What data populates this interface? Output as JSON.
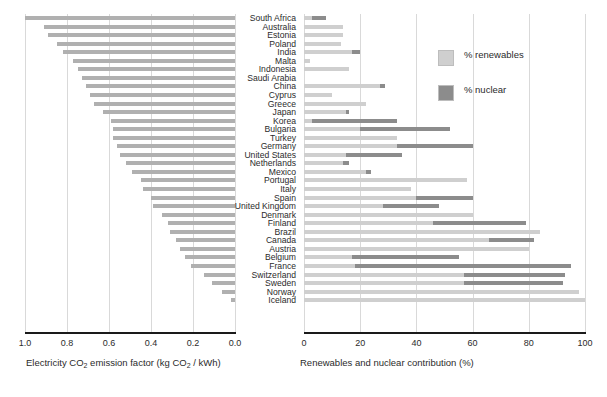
{
  "chart_data": [
    {
      "id": "left",
      "type": "bar",
      "orientation": "horizontal",
      "title": "",
      "xlabel": "Electricity CO2 emission factor (kg CO2 / kWh)",
      "xlabel_html": "Electricity CO<sub>2</sub> emission factor (kg CO<sub>2</sub> / kWh)",
      "ylabel": "",
      "xlim": [
        1.0,
        0.0
      ],
      "reversed_x": true,
      "xticks": [
        "1.0",
        "0.8",
        "0.6",
        "0.4",
        "0.2",
        "0.0"
      ],
      "xtick_values": [
        1.0,
        0.8,
        0.6,
        0.4,
        0.2,
        0.0
      ],
      "grid": true,
      "legend": "none",
      "bar_color": "#b0b0b0",
      "categories": [
        "South Africa",
        "Australia",
        "Estonia",
        "Poland",
        "India",
        "Malta",
        "Indonesia",
        "Saudi Arabia",
        "China",
        "Cyprus",
        "Greece",
        "Japan",
        "Korea",
        "Bulgaria",
        "Turkey",
        "Germany",
        "United States",
        "Netherlands",
        "Mexico",
        "Portugal",
        "Italy",
        "Spain",
        "United Kingdom",
        "Denmark",
        "Finland",
        "Brazil",
        "Canada",
        "Austria",
        "Belgium",
        "France",
        "Switzerland",
        "Sweden",
        "Norway",
        "Iceland"
      ],
      "values": [
        1.0,
        0.91,
        0.89,
        0.85,
        0.82,
        0.77,
        0.75,
        0.73,
        0.71,
        0.69,
        0.67,
        0.63,
        0.59,
        0.58,
        0.58,
        0.56,
        0.55,
        0.52,
        0.49,
        0.45,
        0.44,
        0.4,
        0.39,
        0.35,
        0.32,
        0.31,
        0.28,
        0.26,
        0.24,
        0.21,
        0.15,
        0.11,
        0.06,
        0.02
      ]
    },
    {
      "id": "right",
      "type": "bar",
      "stacked": true,
      "orientation": "horizontal",
      "title": "",
      "xlabel": "Renewables and nuclear contribution (%)",
      "ylabel": "",
      "xlim": [
        0,
        100
      ],
      "xticks": [
        "0",
        "20",
        "40",
        "60",
        "80",
        "100"
      ],
      "xtick_values": [
        0,
        20,
        40,
        60,
        80,
        100
      ],
      "grid": true,
      "legend_position": "top-right",
      "categories": [
        "South Africa",
        "Australia",
        "Estonia",
        "Poland",
        "India",
        "Malta",
        "Indonesia",
        "Saudi Arabia",
        "China",
        "Cyprus",
        "Greece",
        "Japan",
        "Korea",
        "Bulgaria",
        "Turkey",
        "Germany",
        "United States",
        "Netherlands",
        "Mexico",
        "Portugal",
        "Italy",
        "Spain",
        "United Kingdom",
        "Denmark",
        "Finland",
        "Brazil",
        "Canada",
        "Austria",
        "Belgium",
        "France",
        "Switzerland",
        "Sweden",
        "Norway",
        "Iceland"
      ],
      "series": [
        {
          "name": "% renewables",
          "color": "#cfcfcf",
          "values": [
            3,
            14,
            14,
            13,
            17,
            2,
            16,
            0,
            27,
            10,
            22,
            15,
            3,
            20,
            33,
            33,
            15,
            14,
            22,
            58,
            38,
            40,
            28,
            60,
            46,
            84,
            66,
            80,
            17,
            18,
            57,
            57,
            98,
            100
          ]
        },
        {
          "name": "% nuclear",
          "color": "#8c8c8c",
          "values": [
            5,
            0,
            0,
            0,
            3,
            0,
            0,
            0,
            2,
            0,
            0,
            1,
            30,
            32,
            0,
            27,
            20,
            2,
            2,
            0,
            0,
            20,
            20,
            0,
            33,
            0,
            16,
            0,
            38,
            77,
            36,
            35,
            0,
            0
          ]
        }
      ]
    }
  ],
  "legend": {
    "items": [
      {
        "label": "% renewables",
        "color": "#cfcfcf",
        "swatch": "legend-swatch-renewables"
      },
      {
        "label": "% nuclear",
        "color": "#8c8c8c",
        "swatch": "legend-swatch-nuclear"
      }
    ]
  },
  "axes": {
    "left": {
      "label_prefix": "Electricity CO",
      "label_sub1": "2",
      "label_mid": " emission factor (kg CO",
      "label_sub2": "2",
      "label_suffix": " / kWh)",
      "ticks": [
        "1.0",
        "0.8",
        "0.6",
        "0.4",
        "0.2",
        "0.0"
      ]
    },
    "right": {
      "label": "Renewables and nuclear contribution (%)",
      "ticks": [
        "0",
        "20",
        "40",
        "60",
        "80",
        "100"
      ]
    }
  },
  "colors": {
    "renewables": "#cfcfcf",
    "nuclear": "#8c8c8c",
    "emission_bar": "#b0b0b0",
    "gridline": "#d9d9d9",
    "axis": "#1a1a1a"
  }
}
